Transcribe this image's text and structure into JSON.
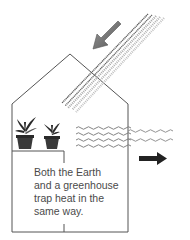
{
  "diagram": {
    "caption_lines": [
      "Both the Earth",
      "and a greenhouse",
      "trap heat in the",
      "same way."
    ],
    "elements": {
      "incoming_arrow": "incoming-sunlight-arrow",
      "outgoing_arrow": "outgoing-heat-arrow",
      "house": "greenhouse-outline",
      "plants": [
        "potted-plant-large",
        "potted-plant-small"
      ]
    },
    "colors": {
      "outline": "#555555",
      "incoming_arrow": "#777777",
      "outgoing_arrow": "#222222",
      "dark_rays": "#666666",
      "light_rays": "#aaaaaa",
      "text": "#4a4a4a",
      "pot": "#333333",
      "leaf": "#2a2a2a"
    }
  }
}
